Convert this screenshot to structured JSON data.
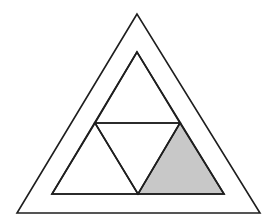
{
  "diagram": {
    "colors": {
      "background": "#ffffff",
      "stroke": "#1e1e1e",
      "shade": "#c8c8c8"
    },
    "stroke_width": 1.6,
    "outer_triangle": {
      "points": "137,14 17,213 260,213"
    },
    "inner_triangle": {
      "points": "137,52 52,194 224,194"
    },
    "sub_triangles": [
      {
        "id": "top",
        "points": "137,52 95,123 180,123",
        "shaded": false
      },
      {
        "id": "bottom-left",
        "points": "95,123 52,194 138,194",
        "shaded": false
      },
      {
        "id": "center",
        "points": "95,123 180,123 138,194",
        "shaded": false
      },
      {
        "id": "bottom-right",
        "points": "180,123 138,194 224,194",
        "shaded": true
      }
    ]
  }
}
